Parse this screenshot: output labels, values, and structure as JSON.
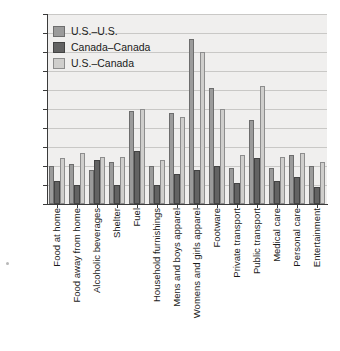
{
  "chart_data": {
    "type": "bar",
    "title": "",
    "subtitle": "",
    "xlabel": "",
    "ylabel": "",
    "ylim": [
      0,
      0.1
    ],
    "ytick_labels": [
      "0.10",
      "0.09",
      "0.08",
      "0.07",
      "0.06",
      "0.05",
      "0.04",
      "0.03",
      "0.02",
      "0.01",
      "0"
    ],
    "ytick_values": [
      0.1,
      0.09,
      0.08,
      0.07,
      0.06,
      0.05,
      0.04,
      0.03,
      0.02,
      0.01,
      0
    ],
    "grid": true,
    "legend_position": "top-left",
    "categories": [
      "Food at home",
      "Food away from home",
      "Alcoholic beverages",
      "Shelter",
      "Fuel",
      "Household furnishings",
      "Mens and boys apparel",
      "Womens and girls apparel",
      "Footware",
      "Private transport",
      "Public transport",
      "Medical care",
      "Personal care",
      "Entertainment"
    ],
    "series": [
      {
        "name": "U.S.–U.S.",
        "color": "#9b9b9b",
        "values": [
          0.02,
          0.021,
          0.018,
          0.022,
          0.049,
          0.02,
          0.048,
          0.087,
          0.061,
          0.019,
          0.044,
          0.019,
          0.026,
          0.02
        ]
      },
      {
        "name": "Canada–Canada",
        "color": "#636363",
        "values": [
          0.012,
          0.01,
          0.023,
          0.01,
          0.028,
          0.01,
          0.016,
          0.018,
          0.02,
          0.011,
          0.024,
          0.012,
          0.014,
          0.009
        ]
      },
      {
        "name": "U.S.–Canada",
        "color": "#cfcecc",
        "values": [
          0.024,
          0.027,
          0.025,
          0.025,
          0.05,
          0.023,
          0.046,
          0.08,
          0.05,
          0.026,
          0.062,
          0.025,
          0.027,
          0.022
        ]
      }
    ]
  },
  "legend": {
    "items": [
      {
        "label": "U.S.–U.S.",
        "swatch": "#9b9b9b"
      },
      {
        "label": "Canada–Canada",
        "swatch": "#636363"
      },
      {
        "label": "U.S.–Canada",
        "swatch": "#cfcecc"
      }
    ]
  },
  "colors": {
    "series_us_us": "#9b9b9b",
    "series_canada_canada": "#636363",
    "series_us_canada": "#cfcecc",
    "plot_background": "#f0efee",
    "gridline": "#c9c8c6",
    "axis": "#3b3b3b",
    "text": "#1a1a1a"
  }
}
